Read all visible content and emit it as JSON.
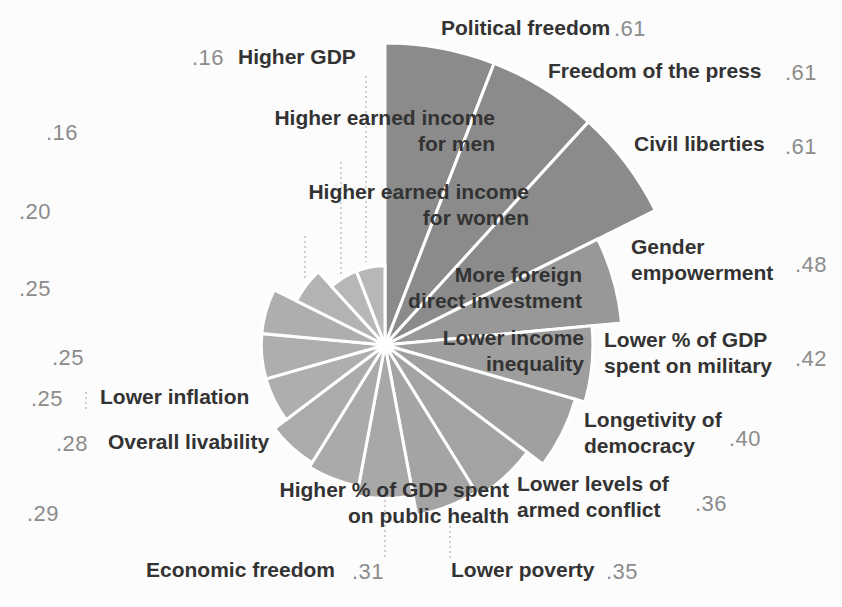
{
  "chart_data": {
    "type": "pie",
    "variant": "polar-area-rose",
    "title": "",
    "direction": "clockwise",
    "start_angle_deg": 0,
    "num_sectors": 17,
    "value_range": [
      0,
      0.61
    ],
    "legend": "none",
    "items": [
      {
        "slug": "political-freedom",
        "label": "Political freedom",
        "lines": [
          "Political freedom"
        ],
        "value": 0.61,
        "value_text": ".61"
      },
      {
        "slug": "freedom-of-the-press",
        "label": "Freedom of the press",
        "lines": [
          "Freedom of the press"
        ],
        "value": 0.61,
        "value_text": ".61"
      },
      {
        "slug": "civil-liberties",
        "label": "Civil liberties",
        "lines": [
          "Civil liberties"
        ],
        "value": 0.61,
        "value_text": ".61"
      },
      {
        "slug": "gender-empowerment",
        "label": "Gender empowerment",
        "lines": [
          "Gender",
          "empowerment"
        ],
        "value": 0.48,
        "value_text": ".48"
      },
      {
        "slug": "lower-gdp-military",
        "label": "Lower % of GDP spent on military",
        "lines": [
          "Lower % of GDP",
          "spent on military"
        ],
        "value": 0.42,
        "value_text": ".42"
      },
      {
        "slug": "longetivity-of-democracy",
        "label": "Longetivity of democracy",
        "lines": [
          "Longetivity of",
          "democracy"
        ],
        "value": 0.4,
        "value_text": ".40"
      },
      {
        "slug": "lower-armed-conflict",
        "label": "Lower levels of armed conflict",
        "lines": [
          "Lower levels of",
          "armed conflict"
        ],
        "value": 0.36,
        "value_text": ".36"
      },
      {
        "slug": "lower-poverty",
        "label": "Lower poverty",
        "lines": [
          "Lower poverty"
        ],
        "value": 0.35,
        "value_text": ".35"
      },
      {
        "slug": "economic-freedom",
        "label": "Economic freedom",
        "lines": [
          "Economic freedom"
        ],
        "value": 0.31,
        "value_text": ".31"
      },
      {
        "slug": "gdp-public-health",
        "label": "Higher % of GDP spent on public health",
        "lines": [
          "Higher % of GDP spent",
          "on public health"
        ],
        "value": 0.29,
        "value_text": ".29"
      },
      {
        "slug": "overall-livability",
        "label": "Overall livability",
        "lines": [
          "Overall livability"
        ],
        "value": 0.28,
        "value_text": ".28"
      },
      {
        "slug": "lower-inflation",
        "label": "Lower inflation",
        "lines": [
          "Lower inflation"
        ],
        "value": 0.25,
        "value_text": ".25"
      },
      {
        "slug": "lower-income-inequality",
        "label": "Lower income inequality",
        "lines": [
          "Lower income",
          "inequality"
        ],
        "value": 0.25,
        "value_text": ".25"
      },
      {
        "slug": "foreign-direct-investment",
        "label": "More foreign direct investment",
        "lines": [
          "More foreign",
          "direct investment"
        ],
        "value": 0.25,
        "value_text": ".25"
      },
      {
        "slug": "earned-income-women",
        "label": "Higher earned income for women",
        "lines": [
          "Higher earned income",
          "for women"
        ],
        "value": 0.2,
        "value_text": ".20"
      },
      {
        "slug": "earned-income-men",
        "label": "Higher earned income for men",
        "lines": [
          "Higher earned income",
          "for men"
        ],
        "value": 0.16,
        "value_text": ".16"
      },
      {
        "slug": "higher-gdp",
        "label": "Higher GDP",
        "lines": [
          "Higher GDP"
        ],
        "value": 0.16,
        "value_text": ".16"
      }
    ],
    "colors": {
      "wedge_max": "#8b8b8b",
      "wedge_min": "#b7b7b7",
      "wedge_gap": "#ffffff",
      "label_text": "#333333",
      "value_text": "#8c8c8c",
      "leader_line": "#bcbcbc",
      "background": "#fcfcfc"
    }
  }
}
